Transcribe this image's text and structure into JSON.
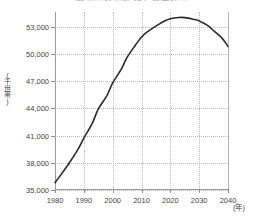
{
  "chart_data": {
    "type": "line",
    "title": "一般世帯数の推移と将来推計",
    "xlabel": "(年)",
    "ylabel": "(千世帯)",
    "xlim": [
      1980,
      2040
    ],
    "ylim": [
      35000,
      54600
    ],
    "grid": true,
    "legend": "none",
    "x_ticks": [
      "1980",
      "1990",
      "2000",
      "2010",
      "2020",
      "2030",
      "2040"
    ],
    "x_tick_values": [
      1980,
      1990,
      2000,
      2010,
      2020,
      2030,
      2040
    ],
    "y_ticks": [
      "35,000",
      "38,000",
      "41,000",
      "44,000",
      "47,000",
      "50,000",
      "53,000"
    ],
    "y_tick_values": [
      35000,
      38000,
      41000,
      44000,
      47000,
      50000,
      53000
    ],
    "line_color": "#2b2b2b",
    "series": [
      {
        "name": "一般世帯数",
        "x": [
          1980,
          1983,
          1985,
          1988,
          1990,
          1993,
          1995,
          1998,
          2000,
          2003,
          2005,
          2008,
          2010,
          2012,
          2015,
          2018,
          2020,
          2023,
          2025,
          2028,
          2030,
          2033,
          2035,
          2038,
          2040
        ],
        "values": [
          35800,
          37100,
          38000,
          39500,
          40700,
          42400,
          43900,
          45400,
          46800,
          48300,
          49600,
          51000,
          51850,
          52400,
          53050,
          53600,
          53850,
          54000,
          53980,
          53800,
          53620,
          53100,
          52550,
          51700,
          50800
        ]
      }
    ]
  },
  "axes": {
    "y_axis_label": "(千世帯)",
    "x_axis_label": "(年)"
  }
}
